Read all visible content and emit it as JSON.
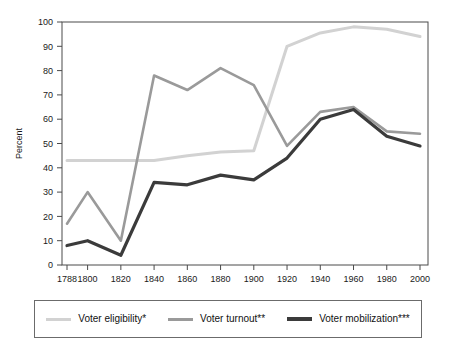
{
  "chart_data": {
    "type": "line",
    "title": "",
    "xlabel": "",
    "ylabel": "Percent",
    "ylim": [
      0,
      100
    ],
    "yticks": [
      0,
      10,
      20,
      30,
      40,
      50,
      60,
      70,
      80,
      90,
      100
    ],
    "grid": false,
    "legend_position": "bottom",
    "categories": [
      "1788",
      "1800",
      "1820",
      "1840",
      "1860",
      "1880",
      "1900",
      "1920",
      "1940",
      "1960",
      "1980",
      "2000"
    ],
    "series": [
      {
        "name": "Voter eligibility*",
        "color": "#d2d2d2",
        "width": 3,
        "values": [
          43,
          43,
          43,
          43,
          45,
          46.5,
          47,
          90,
          95.5,
          98,
          97,
          94
        ]
      },
      {
        "name": "Voter turnout**",
        "color": "#9a9a9a",
        "width": 2.6,
        "values": [
          17,
          30,
          10,
          78,
          72,
          81,
          74,
          49,
          63,
          65,
          55,
          54
        ]
      },
      {
        "name": "Voter mobilization***",
        "color": "#3b3b3b",
        "width": 3.2,
        "values": [
          8,
          10,
          4,
          34,
          33,
          37,
          35,
          44,
          60,
          64,
          53,
          49
        ]
      }
    ],
    "notes": {
      "eligibility_1840_kink": 43,
      "eligibility_jump_year": "1920",
      "turnout_peak_year": "1880",
      "turnout_peak_value": 81,
      "mobilization_peak_year": "1960",
      "mobilization_peak_value": 64
    }
  },
  "legend": {
    "items": [
      {
        "label": "Voter eligibility*",
        "color": "#d2d2d2",
        "thickness": "3px"
      },
      {
        "label": "Voter turnout**",
        "color": "#9a9a9a",
        "thickness": "3px"
      },
      {
        "label": "Voter mobilization***",
        "color": "#3b3b3b",
        "thickness": "4px"
      }
    ]
  },
  "axes": {
    "y_label": "Percent",
    "y_ticks": [
      "100",
      "90",
      "80",
      "70",
      "60",
      "50",
      "40",
      "30",
      "20",
      "10",
      "0"
    ],
    "x_ticks": [
      "1788",
      "1800",
      "1820",
      "1840",
      "1860",
      "1880",
      "1900",
      "1920",
      "1940",
      "1960",
      "1980",
      "2000"
    ]
  }
}
